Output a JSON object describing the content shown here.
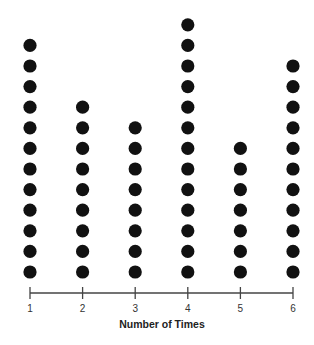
{
  "chart_data": {
    "type": "dot",
    "title": "",
    "xlabel": "Number of Times",
    "ylabel": "",
    "categories": [
      "1",
      "2",
      "3",
      "4",
      "5",
      "6"
    ],
    "values": [
      12,
      9,
      8,
      13,
      7,
      11
    ],
    "grid": false,
    "legend": null,
    "dot_color": "#111111",
    "axis_color": "#444444"
  }
}
